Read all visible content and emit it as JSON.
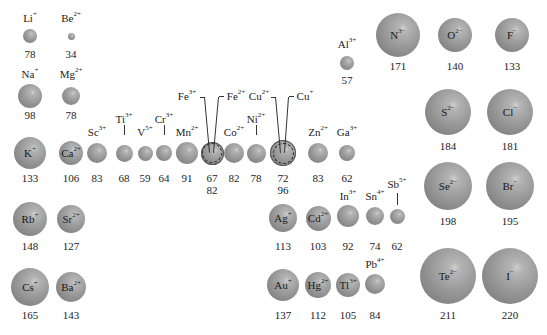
{
  "figure": {
    "title": "",
    "units_note": "",
    "ions": [
      {
        "id": "li",
        "el": "Li",
        "charge": "+",
        "radius": "78"
      },
      {
        "id": "be",
        "el": "Be",
        "charge": "2+",
        "radius": "34"
      },
      {
        "id": "na",
        "el": "Na",
        "charge": "+",
        "radius": "98"
      },
      {
        "id": "mg",
        "el": "Mg",
        "charge": "2+",
        "radius": "78"
      },
      {
        "id": "k",
        "el": "K",
        "charge": "+",
        "radius": "133"
      },
      {
        "id": "ca",
        "el": "Ca",
        "charge": "2+",
        "radius": "106"
      },
      {
        "id": "sc",
        "el": "Sc",
        "charge": "3+",
        "radius": "83"
      },
      {
        "id": "ti",
        "el": "Ti",
        "charge": "3+",
        "radius": "68"
      },
      {
        "id": "v",
        "el": "V",
        "charge": "5+",
        "radius": "59"
      },
      {
        "id": "cr",
        "el": "Cr",
        "charge": "3+",
        "radius": "64"
      },
      {
        "id": "mn",
        "el": "Mn",
        "charge": "2+",
        "radius": "91"
      },
      {
        "id": "fe3",
        "el": "Fe",
        "charge": "3+",
        "radius": "67"
      },
      {
        "id": "fe2",
        "el": "Fe",
        "charge": "2+",
        "radius": "82"
      },
      {
        "id": "co",
        "el": "Co",
        "charge": "2+",
        "radius": "82"
      },
      {
        "id": "ni",
        "el": "Ni",
        "charge": "2+",
        "radius": "78"
      },
      {
        "id": "cu2",
        "el": "Cu",
        "charge": "2+",
        "radius": "72"
      },
      {
        "id": "cu1",
        "el": "Cu",
        "charge": "+",
        "radius": "96"
      },
      {
        "id": "zn",
        "el": "Zn",
        "charge": "2+",
        "radius": "83"
      },
      {
        "id": "al",
        "el": "Al",
        "charge": "3+",
        "radius": "57"
      },
      {
        "id": "ga",
        "el": "Ga",
        "charge": "3+",
        "radius": "62"
      },
      {
        "id": "rb",
        "el": "Rb",
        "charge": "+",
        "radius": "148"
      },
      {
        "id": "sr",
        "el": "Sr",
        "charge": "2+",
        "radius": "127"
      },
      {
        "id": "ag",
        "el": "Ag",
        "charge": "+",
        "radius": "113"
      },
      {
        "id": "cd",
        "el": "Cd",
        "charge": "2+",
        "radius": "103"
      },
      {
        "id": "in",
        "el": "In",
        "charge": "3+",
        "radius": "92"
      },
      {
        "id": "sn",
        "el": "Sn",
        "charge": "4+",
        "radius": "74"
      },
      {
        "id": "sb",
        "el": "Sb",
        "charge": "5+",
        "radius": "62"
      },
      {
        "id": "cs",
        "el": "Cs",
        "charge": "+",
        "radius": "165"
      },
      {
        "id": "ba",
        "el": "Ba",
        "charge": "2+",
        "radius": "143"
      },
      {
        "id": "au",
        "el": "Au",
        "charge": "+",
        "radius": "137"
      },
      {
        "id": "hg",
        "el": "Hg",
        "charge": "2+",
        "radius": "112"
      },
      {
        "id": "tl",
        "el": "Tl",
        "charge": "3+",
        "radius": "105"
      },
      {
        "id": "pb",
        "el": "Pb",
        "charge": "4+",
        "radius": "84"
      },
      {
        "id": "n",
        "el": "N",
        "charge": "3−",
        "radius": "171"
      },
      {
        "id": "o",
        "el": "O",
        "charge": "2−",
        "radius": "140"
      },
      {
        "id": "f",
        "el": "F",
        "charge": "−",
        "radius": "133"
      },
      {
        "id": "s",
        "el": "S",
        "charge": "2−",
        "radius": "184"
      },
      {
        "id": "cl",
        "el": "Cl",
        "charge": "−",
        "radius": "181"
      },
      {
        "id": "se",
        "el": "Se",
        "charge": "2−",
        "radius": "198"
      },
      {
        "id": "br",
        "el": "Br",
        "charge": "−",
        "radius": "195"
      },
      {
        "id": "te",
        "el": "Te",
        "charge": "2−",
        "radius": "211"
      },
      {
        "id": "i",
        "el": "I",
        "charge": "−",
        "radius": "220"
      }
    ]
  },
  "colors": {
    "sphere": "#999999",
    "highlight": "#cfcfcf",
    "text": "#222222",
    "background": "#ffffff"
  }
}
